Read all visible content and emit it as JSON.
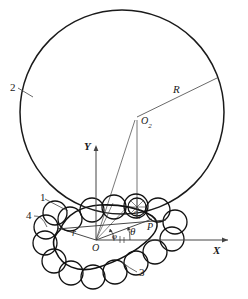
{
  "figure": {
    "background_color": "#ffffff",
    "line_color": "#1a1a1a",
    "thin_line_color": "#555555"
  },
  "labels": {
    "part_2": "2",
    "part_1": "1",
    "part_3": "3",
    "part_4": "4",
    "radius_R": "R",
    "radius_r": "r",
    "center_O2": "O",
    "center_O2_sub": "2",
    "center_O1": "O",
    "center_O1_sub": "1",
    "origin_O": "O",
    "point_P": "P",
    "axis_x": "X",
    "axis_y": "Y",
    "angle_phi": "φ",
    "angle_theta": "θ"
  },
  "geometry": {
    "big_circle": {
      "cx": 122,
      "cy": 112,
      "r": 102,
      "stroke_width": 1.4
    },
    "origin": {
      "x": 96,
      "y": 240
    },
    "point_P": {
      "x": 150,
      "y": 220
    },
    "center_O2": {
      "x": 137,
      "y": 117
    },
    "x_axis": {
      "x1": 96,
      "y1": 240,
      "x2": 232,
      "y2": 240
    },
    "y_axis": {
      "x1": 96,
      "y1": 240,
      "x2": 96,
      "y2": 145
    },
    "roller_radius": 12,
    "roller_count": 20,
    "angle_phi_deg": 40,
    "angle_theta_deg": 20
  },
  "chart_data": {
    "type": "diagram",
    "elements": [
      {
        "name": "2",
        "meaning": "large circle / ring gear pitch circle"
      },
      {
        "name": "1",
        "meaning": "roller element"
      },
      {
        "name": "3",
        "meaning": "roller chain loop"
      },
      {
        "name": "4",
        "meaning": "inner cam contour"
      },
      {
        "name": "R",
        "meaning": "radius of large circle"
      },
      {
        "name": "r",
        "meaning": "polar radius from origin O"
      },
      {
        "name": "O",
        "meaning": "global origin"
      },
      {
        "name": "O2",
        "meaning": "centre of large circle"
      },
      {
        "name": "O1",
        "meaning": "centre of contact roller"
      },
      {
        "name": "P",
        "meaning": "contact / pitch point"
      },
      {
        "name": "phi",
        "meaning": "angle of polar radius r from X axis"
      },
      {
        "name": "theta",
        "meaning": "angle of line OP from X axis"
      }
    ]
  }
}
